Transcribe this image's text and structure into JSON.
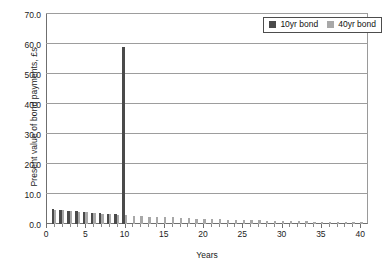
{
  "chart_data": {
    "type": "bar",
    "title": "",
    "xlabel": "Years",
    "ylabel": "Present value of bond payments, £s",
    "xlim": [
      0,
      41
    ],
    "ylim": [
      0,
      70
    ],
    "ytick_labels": [
      "0.0",
      "10.0",
      "20.0",
      "30.0",
      "40.0",
      "50.0",
      "60.0",
      "70.0"
    ],
    "ytick_values": [
      0,
      10,
      20,
      30,
      40,
      50,
      60,
      70
    ],
    "xtick_labels": [
      "0",
      "5",
      "10",
      "15",
      "20",
      "25",
      "30",
      "35",
      "40"
    ],
    "xtick_values": [
      0,
      5,
      10,
      15,
      20,
      25,
      30,
      35,
      40
    ],
    "grid": "horizontal",
    "legend_position": "top-right",
    "series": [
      {
        "name": "10yr bond",
        "color": "#4a4a4a",
        "x": [
          1,
          2,
          3,
          4,
          5,
          6,
          7,
          8,
          9,
          10
        ],
        "values": [
          5.0,
          4.7,
          4.5,
          4.3,
          4.0,
          3.8,
          3.6,
          3.4,
          3.2,
          59.0
        ]
      },
      {
        "name": "40yr bond",
        "color": "#a8a8a8",
        "x": [
          1,
          2,
          3,
          4,
          5,
          6,
          7,
          8,
          9,
          10,
          11,
          12,
          13,
          14,
          15,
          16,
          17,
          18,
          19,
          20,
          21,
          22,
          23,
          24,
          25,
          26,
          27,
          28,
          29,
          30,
          31,
          32,
          33,
          34,
          35,
          36,
          37,
          38,
          39,
          40
        ],
        "values": [
          4.8,
          4.6,
          4.3,
          4.1,
          3.9,
          3.7,
          3.5,
          3.3,
          3.1,
          3.0,
          2.8,
          2.7,
          2.5,
          2.4,
          2.3,
          2.2,
          2.0,
          1.9,
          1.8,
          1.7,
          1.7,
          1.6,
          1.5,
          1.4,
          1.3,
          1.3,
          1.2,
          1.1,
          1.1,
          1.0,
          1.0,
          0.9,
          0.9,
          0.8,
          0.8,
          0.7,
          0.7,
          0.7,
          0.6,
          0.6
        ]
      }
    ],
    "legend": [
      {
        "label": "10yr bond",
        "color": "#4a4a4a"
      },
      {
        "label": "40yr bond",
        "color": "#a8a8a8"
      }
    ]
  }
}
